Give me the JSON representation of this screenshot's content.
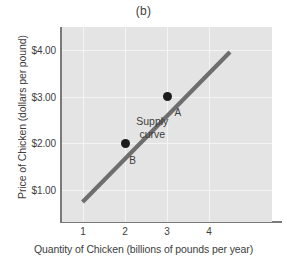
{
  "chart_data": {
    "type": "line",
    "title": "(b)",
    "xlabel": "Quantity of Chicken (billions of pounds per year)",
    "ylabel": "Price of Chicken (dollars per pound)",
    "xlim": [
      0.5,
      5.5
    ],
    "ylim": [
      0.3,
      4.5
    ],
    "xticks": [
      1,
      2,
      3,
      4
    ],
    "xtick_labels": [
      "1",
      "2",
      "3",
      "4"
    ],
    "yticks": [
      1,
      2,
      3,
      4
    ],
    "ytick_labels": [
      "$1.00",
      "$2.00",
      "$3.00",
      "$4.00"
    ],
    "grid": true,
    "legend": "none",
    "series": [
      {
        "name": "Supply curve",
        "type": "line",
        "color": "#6e6e6e",
        "x": [
          0.99,
          4.5
        ],
        "y": [
          0.73,
          3.96
        ],
        "annotation": {
          "lines": [
            "Supply",
            "curve"
          ],
          "x": 2.65,
          "y": 2.45
        }
      }
    ],
    "points": [
      {
        "label": "A",
        "x": 3,
        "y": 3,
        "label_x": 3.18,
        "label_y": 2.78,
        "color": "#1c1c1c"
      },
      {
        "label": "B",
        "x": 2,
        "y": 2,
        "label_x": 2.1,
        "label_y": 1.75,
        "color": "#1c1c1c"
      }
    ],
    "colors": {
      "plot_background": "#e4e4e4",
      "page_background": "#ffffff",
      "gridline": "#f4f4f4",
      "axis": "#7a7a7a",
      "text": "#3d3d3d",
      "curve": "#6e6e6e",
      "marker": "#1c1c1c"
    }
  }
}
